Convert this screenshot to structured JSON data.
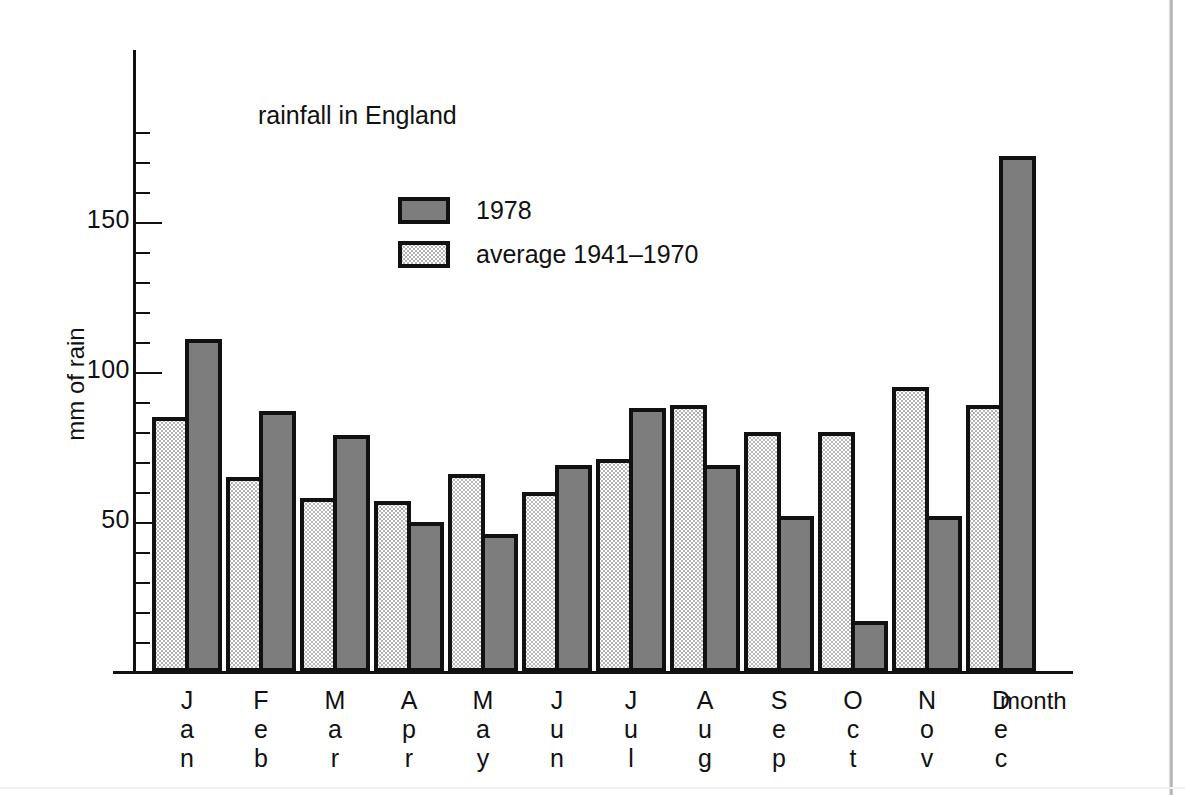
{
  "chart_data": {
    "type": "bar",
    "title": "rainfall in England",
    "xlabel": "month",
    "ylabel": "mm of rain",
    "categories": [
      "Jan",
      "Feb",
      "Mar",
      "Apr",
      "May",
      "Jun",
      "Jul",
      "Aug",
      "Sep",
      "Oct",
      "Nov",
      "Dec"
    ],
    "series": [
      {
        "name": "average 1941-1970",
        "values": [
          85,
          65,
          58,
          57,
          66,
          60,
          71,
          89,
          80,
          80,
          95,
          89
        ],
        "fill": "light-stippled",
        "color": "#ffffff"
      },
      {
        "name": "1978",
        "values": [
          111,
          87,
          79,
          50,
          46,
          69,
          88,
          69,
          52,
          17,
          52,
          172
        ],
        "fill": "solid-gray",
        "color": "#7d7d7d"
      }
    ],
    "ylim": [
      0,
      180
    ],
    "y_major_ticks": [
      50,
      100,
      150
    ],
    "y_minor_tick_step": 10,
    "grid": false,
    "legend_position": "inside-upper-left",
    "series_order_in_group": [
      "average 1941-1970",
      "1978"
    ]
  },
  "legend": {
    "entries": [
      {
        "label": "1978",
        "swatch": "dark-gray-swatch"
      },
      {
        "label": "average 1941–1970",
        "swatch": "light-stippled-swatch"
      }
    ]
  },
  "axis": {
    "y_title": "mm of rain",
    "x_title": "month",
    "y_labels": [
      "150",
      "100",
      "50"
    ]
  }
}
